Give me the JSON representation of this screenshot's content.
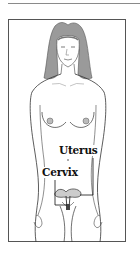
{
  "figure": {
    "labels": {
      "uterus": "Uterus",
      "cervix": "Cervix"
    },
    "colors": {
      "line": "#333333",
      "hair": "#8a8a8a",
      "frame": "#555555",
      "top_rule": "#8a8a8a"
    }
  }
}
